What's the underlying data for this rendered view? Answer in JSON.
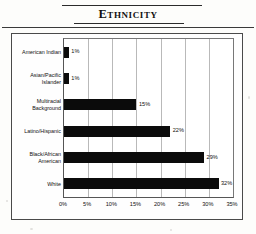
{
  "title_block": {
    "title": "Ethnicity"
  },
  "chart_data": {
    "type": "bar",
    "orientation": "horizontal",
    "title": "Ethnicity",
    "xlabel": "",
    "ylabel": "",
    "categories": [
      "American Indian",
      "Asian/Pacific\nIslander",
      "Multiracial\nBackground",
      "Latino/Hispanic",
      "Black/African\nAmerican",
      "White"
    ],
    "values": [
      1,
      1,
      15,
      22,
      29,
      32
    ],
    "value_labels": [
      "1%",
      "1%",
      "15%",
      "22%",
      "29%",
      "32%"
    ],
    "xlim": [
      0,
      35
    ],
    "xticks": [
      0,
      5,
      10,
      15,
      20,
      25,
      30,
      35
    ],
    "xtick_labels": [
      "0%",
      "5%",
      "10%",
      "15%",
      "20%",
      "25%",
      "30%",
      "35%"
    ],
    "grid": true,
    "grid_axis": "x",
    "legend": false,
    "bar_color": "#0b0b0b",
    "plot_background": "#ffffff",
    "gridline_color": "#b9b9b9"
  }
}
